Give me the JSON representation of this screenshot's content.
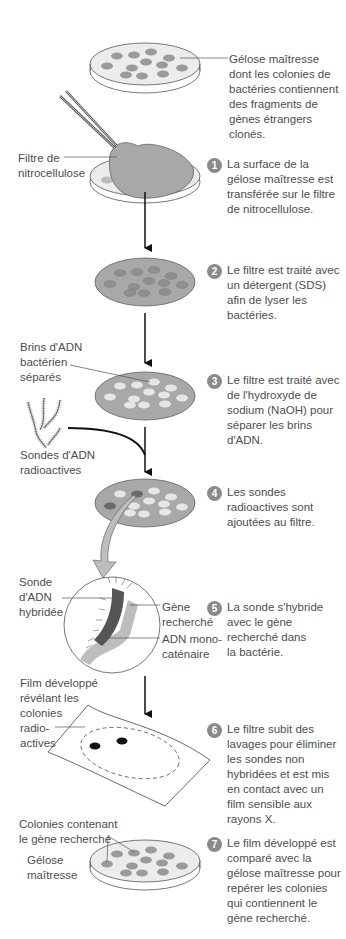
{
  "diagram": {
    "colors": {
      "agar": "#ececec",
      "colony": "#9a9a9a",
      "filter": "#a8a8a8",
      "light_colony": "#e6e6e6",
      "probe_dark": "#555555",
      "gene_light": "#bdbdbd",
      "badge": "#8a8a8a",
      "arrow": "#111111"
    },
    "labels": {
      "master_plate": "Gélose maîtresse\ndont les colonies de\nbactéries contiennent\ndes fragments de\ngènes étrangers\nclonés.",
      "nitro_filter": "Filtre de\nnitrocellulose",
      "separated_strands": "Brins d'ADN\nbactérien\nséparés",
      "radio_probes": "Sondes d'ADN\nradioactives",
      "hybrid_probe": "Sonde\nd'ADN\nhybridée",
      "target_gene": "Gène\nrecherché",
      "single_strand": "ADN mono-\ncaténaire",
      "developed_film": "Film développé\nrévélant les\ncolonies\nradio-\nactives",
      "colonies_with_gene": "Colonies contenant\nle gène recherché",
      "master_plate_short": "Gélose\nmaîtresse"
    },
    "steps": [
      {
        "number": "1",
        "text": "La surface de la\ngélose maîtresse est\ntransférée sur le filtre\nde nitrocellulose."
      },
      {
        "number": "2",
        "text": "Le filtre est traité avec\nun détergent (SDS)\nafin de lyser les\nbactéries."
      },
      {
        "number": "3",
        "text": "Le filtre est traité avec\nde l'hydroxyde de\nsodium (NaOH) pour\nséparer les brins\nd'ADN."
      },
      {
        "number": "4",
        "text": "Les sondes\nradioactives sont\najoutées au filtre."
      },
      {
        "number": "5",
        "text": "La sonde s'hybride\navec le gène\nrecherché dans\nla bactérie."
      },
      {
        "number": "6",
        "text": "Le filtre subit des\nlavages pour éliminer\nles sondes non\nhybridées et est mis\nen contact avec un\nfilm sensible aux\nrayons X."
      },
      {
        "number": "7",
        "text": "Le film développé est\ncomparé avec la\ngélose maîtresse pour\nrepérer les colonies\nqui contiennent le\ngène recherché."
      }
    ]
  }
}
